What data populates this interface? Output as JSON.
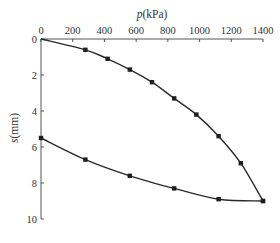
{
  "chart_data": {
    "type": "line",
    "title": "",
    "xlabel": "p(kPa)",
    "xlabel_italic": "p",
    "xlabel_unit": "(kPa)",
    "ylabel": "s(mm)",
    "ylabel_italic": "s",
    "ylabel_unit": "(mm)",
    "x_axis_position": "top",
    "y_axis_inverted": true,
    "xlim": [
      0,
      1400
    ],
    "ylim": [
      0,
      10
    ],
    "x_ticks": [
      0,
      200,
      400,
      600,
      800,
      1000,
      1200,
      1400
    ],
    "y_ticks": [
      0,
      2,
      4,
      6,
      8,
      10
    ],
    "grid": false,
    "legend": null,
    "series": [
      {
        "name": "loading",
        "marker": "square",
        "x": [
          0,
          280,
          420,
          560,
          700,
          840,
          980,
          1120,
          1260,
          1400
        ],
        "y": [
          0,
          0.6,
          1.1,
          1.7,
          2.4,
          3.3,
          4.2,
          5.4,
          6.9,
          9.0
        ]
      },
      {
        "name": "unloading",
        "marker": "square",
        "x": [
          1400,
          1120,
          840,
          560,
          280,
          0
        ],
        "y": [
          9.0,
          8.9,
          8.3,
          7.6,
          6.7,
          5.5
        ]
      }
    ]
  }
}
